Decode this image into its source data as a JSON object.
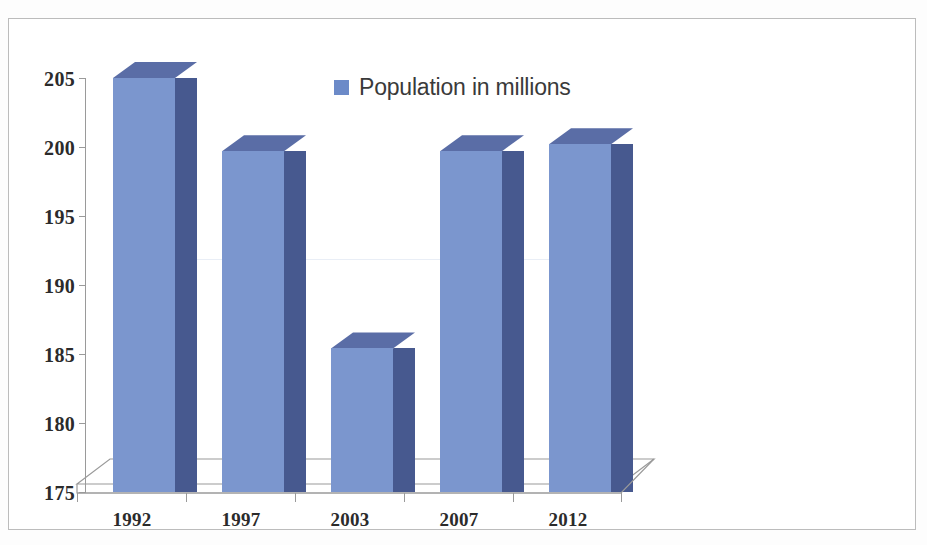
{
  "chart_data": {
    "type": "bar",
    "title": "",
    "subtitle": "",
    "xlabel": "",
    "ylabel": "",
    "categories": [
      "1992",
      "1997",
      "2003",
      "2007",
      "2012"
    ],
    "series": [
      {
        "name": "Population in millions",
        "values": [
          205.0,
          199.7,
          185.4,
          199.7,
          200.2
        ],
        "color": "#7b96ce"
      }
    ],
    "ylim": [
      175,
      205
    ],
    "yticks": [
      175,
      180,
      185,
      190,
      195,
      200,
      205
    ],
    "ytick_labels": [
      "175",
      "180",
      "185",
      "190",
      "195",
      "200",
      "205"
    ],
    "grid": true,
    "gridlines_visible": [
      190
    ],
    "legend": {
      "position": "top-center",
      "entries": [
        {
          "label": "Population in millions",
          "color": "#6c8ac8",
          "marker": "square"
        }
      ]
    },
    "style": {
      "effect": "3d-column",
      "bar_front_color": "#7b96ce",
      "bar_side_color": "#47598f",
      "bar_top_color": "#5a6da6",
      "axis_color": "#9a9a9a",
      "floor_color": "#ffffff",
      "frame_color": "#bcbcbc",
      "background": "#ffffff",
      "text_color": "#2b2b2b"
    }
  },
  "legend": {
    "swatch_name": "legend-color-swatch",
    "label": "Population in millions"
  },
  "axes": {
    "y_labels": [
      "205",
      "200",
      "195",
      "190",
      "185",
      "180",
      "175"
    ],
    "x_labels": [
      "1992",
      "1997",
      "2003",
      "2007",
      "2012"
    ]
  }
}
